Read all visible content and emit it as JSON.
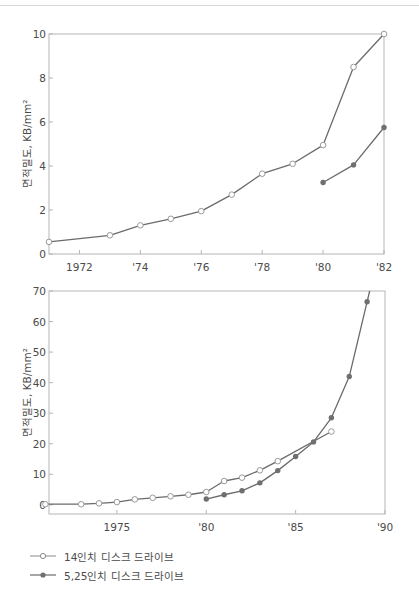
{
  "chart_data": [
    {
      "type": "line",
      "title": "",
      "xlabel": "",
      "ylabel": "면적밀도, KB/mm²",
      "xlim": [
        1971,
        1982
      ],
      "ylim": [
        0,
        10
      ],
      "xticks": [
        1972,
        1974,
        1976,
        1978,
        1980,
        1982
      ],
      "xtick_labels": [
        "1972",
        "'74",
        "'76",
        "'78",
        "'80",
        "'82"
      ],
      "yticks": [
        0,
        2,
        4,
        6,
        8,
        10
      ],
      "ytick_labels": [
        "0",
        "2",
        "4",
        "6",
        "8",
        "10"
      ],
      "grid": false,
      "series": [
        {
          "name": "14인치 디스크 드라이브",
          "marker": "open-circle",
          "x": [
            1971,
            1973,
            1974,
            1975,
            1976,
            1977,
            1978,
            1979,
            1980,
            1981,
            1982
          ],
          "values": [
            0.55,
            0.85,
            1.3,
            1.6,
            1.95,
            2.7,
            3.65,
            4.1,
            4.95,
            8.5,
            10.0
          ]
        },
        {
          "name": "5.25인치 디스크 드라이브",
          "marker": "filled-circle",
          "x": [
            1980,
            1981,
            1982
          ],
          "values": [
            3.25,
            4.05,
            5.75
          ]
        }
      ]
    },
    {
      "type": "line",
      "title": "",
      "xlabel": "",
      "ylabel": "면적밀도, KB/mm²",
      "xlim": [
        1971.2,
        1990
      ],
      "ylim": [
        -3,
        70
      ],
      "xticks": [
        1975,
        1980,
        1985,
        1990
      ],
      "xtick_labels": [
        "1975",
        "'80",
        "'85",
        "'90"
      ],
      "yticks": [
        0,
        10,
        20,
        30,
        40,
        50,
        60,
        70
      ],
      "ytick_labels": [
        "0",
        "10",
        "20",
        "30",
        "40",
        "50",
        "60",
        "70"
      ],
      "grid": false,
      "legend_position": "below-left",
      "series": [
        {
          "name": "14인치 디스크 드라이브",
          "marker": "open-circle",
          "x": [
            1971,
            1973,
            1974,
            1975,
            1976,
            1977,
            1978,
            1979,
            1980,
            1981,
            1982,
            1983,
            1984,
            1987
          ],
          "values": [
            0.2,
            0.2,
            0.5,
            0.9,
            1.8,
            2.3,
            2.8,
            3.3,
            4.2,
            7.8,
            8.9,
            11.3,
            14.3,
            24.0
          ]
        },
        {
          "name": "5.25인치 디스크 드라이브",
          "marker": "filled-circle",
          "x": [
            1980,
            1981,
            1982,
            1983,
            1984,
            1985,
            1986,
            1987,
            1988,
            1989
          ],
          "values": [
            1.9,
            3.3,
            4.6,
            7.2,
            11.2,
            15.8,
            20.6,
            28.5,
            42.0,
            66.5
          ]
        }
      ]
    }
  ],
  "legend": {
    "items": [
      {
        "label": "14인치 디스크 드라이브",
        "marker": "open-circle"
      },
      {
        "label": "5.25인치 디스크 드라이브",
        "marker": "filled-circle"
      }
    ],
    "label_display": [
      "14인치 디스크 드라이브",
      "5,25인치 디스크 드라이브"
    ]
  },
  "colors": {
    "line": "#6b6b6b",
    "frame": "#b5b5b5",
    "filled_marker": "#6f6f6f",
    "open_marker_fill": "#ffffff"
  }
}
